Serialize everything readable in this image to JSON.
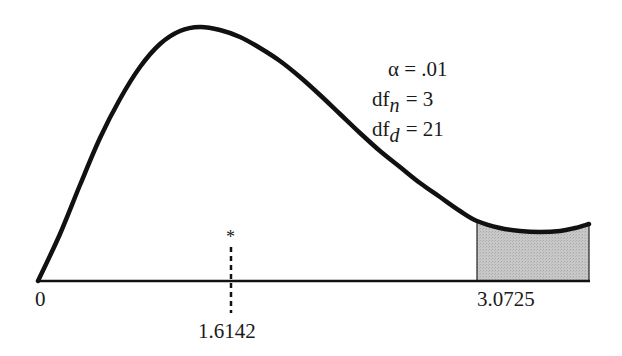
{
  "chart_data": {
    "type": "area",
    "title": "",
    "subtitle": "",
    "distribution": "F",
    "xlabel": "",
    "ylabel": "",
    "grid": false,
    "legend": null,
    "parameters": {
      "alpha": ".01",
      "df_n": "3",
      "df_d": "21"
    },
    "x_tick_labels": [
      "0",
      "3.0725"
    ],
    "critical_value": 3.0725,
    "observed_value": 1.6142,
    "observed_marker": "*",
    "shaded_region": {
      "from": 3.0725,
      "to": "right edge",
      "meaning": "rejection region (alpha = .01)"
    },
    "curve_points_px": [
      [
        38,
        281
      ],
      [
        60,
        234
      ],
      [
        80,
        185
      ],
      [
        100,
        138
      ],
      [
        120,
        99
      ],
      [
        140,
        67
      ],
      [
        160,
        44
      ],
      [
        180,
        31
      ],
      [
        200,
        27
      ],
      [
        220,
        30
      ],
      [
        240,
        37
      ],
      [
        260,
        48
      ],
      [
        280,
        61
      ],
      [
        300,
        77
      ],
      [
        320,
        95
      ],
      [
        340,
        114
      ],
      [
        360,
        133
      ],
      [
        380,
        151
      ],
      [
        400,
        167
      ],
      [
        420,
        183
      ],
      [
        440,
        197
      ],
      [
        460,
        211
      ],
      [
        477,
        221
      ],
      [
        500,
        228
      ],
      [
        520,
        231
      ],
      [
        540,
        232
      ],
      [
        560,
        231
      ],
      [
        575,
        228
      ],
      [
        589,
        224
      ]
    ]
  },
  "labels": {
    "alpha_symbol": "α",
    "alpha_value": " = .01",
    "dfn_prefix": "df",
    "dfn_sub": "n",
    "dfn_value": " = 3",
    "dfd_prefix": "df",
    "dfd_sub": "d",
    "dfd_value": " = 21",
    "x_zero": "0",
    "x_critical": "3.0725",
    "x_observed": "1.6142",
    "observed_marker": "*"
  },
  "colors": {
    "curve": "#111111",
    "axis": "#111111",
    "shade": "#c4c4c4",
    "background": "#ffffff"
  }
}
